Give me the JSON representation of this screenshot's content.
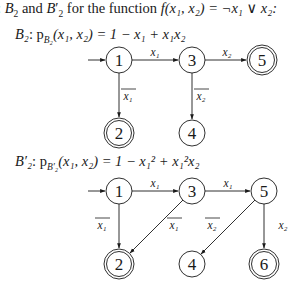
{
  "intro": {
    "prefix": ": ",
    "b2": "B",
    "b2_sub": "2",
    "and": " and ",
    "b2p": "B",
    "b2p_sub": "2",
    "b2p_prime": "′",
    "rest": " for the function ",
    "func": "f(x₁, x₂) = ¬x₁ ∨ x₂:"
  },
  "graphs": [
    {
      "name": "B2",
      "header_name": "B₂",
      "header_formula": ": p",
      "header_sub": "B₂",
      "header_tail": "(x₁, x₂) = 1 − x₁ + x₁x₂",
      "nodes": [
        {
          "id": "1",
          "label": "1",
          "accepting": false,
          "start": true
        },
        {
          "id": "3",
          "label": "3",
          "accepting": false
        },
        {
          "id": "5",
          "label": "5",
          "accepting": true
        },
        {
          "id": "2",
          "label": "2",
          "accepting": true
        },
        {
          "id": "4",
          "label": "4",
          "accepting": false
        }
      ],
      "edges": [
        {
          "from": "1",
          "to": "3",
          "label": "x₁",
          "negated": false
        },
        {
          "from": "3",
          "to": "5",
          "label": "x₂",
          "negated": false
        },
        {
          "from": "1",
          "to": "2",
          "label": "x₁",
          "negated": true
        },
        {
          "from": "3",
          "to": "4",
          "label": "x₂",
          "negated": true
        }
      ]
    },
    {
      "name": "B2prime",
      "header_name": "B′₂",
      "header_formula": ": p",
      "header_sub": "B′₂",
      "header_tail": "(x₁, x₂) = 1 − x₁² + x₁²x₂",
      "nodes": [
        {
          "id": "1",
          "label": "1",
          "accepting": false,
          "start": true
        },
        {
          "id": "3",
          "label": "3",
          "accepting": false
        },
        {
          "id": "5",
          "label": "5",
          "accepting": false
        },
        {
          "id": "2",
          "label": "2",
          "accepting": true
        },
        {
          "id": "4",
          "label": "4",
          "accepting": false
        },
        {
          "id": "6",
          "label": "6",
          "accepting": true
        }
      ],
      "edges": [
        {
          "from": "1",
          "to": "3",
          "label": "x₁",
          "negated": false
        },
        {
          "from": "3",
          "to": "5",
          "label": "x₁",
          "negated": false
        },
        {
          "from": "1",
          "to": "2",
          "label": "x₁",
          "negated": true
        },
        {
          "from": "3",
          "to": "2",
          "label": "x₁",
          "negated": true
        },
        {
          "from": "5",
          "to": "4",
          "label": "x₂",
          "negated": true
        },
        {
          "from": "5",
          "to": "6",
          "label": "x₂",
          "negated": false
        }
      ]
    }
  ]
}
